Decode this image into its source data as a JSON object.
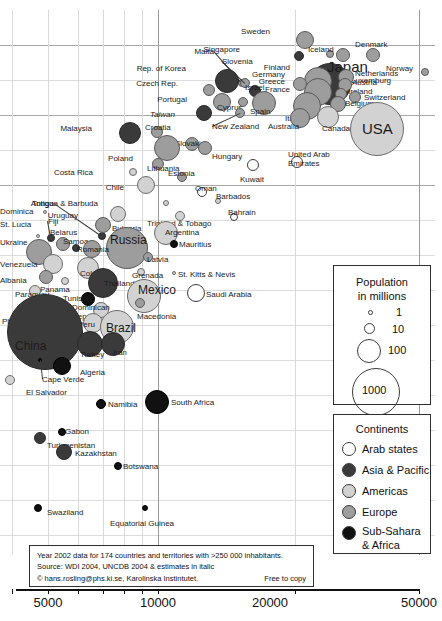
{
  "chart_data": {
    "type": "scatter",
    "title": "",
    "xlabel": "",
    "ylabel": "",
    "xscale": "log",
    "xticks": [
      "5000",
      "10000",
      "20000",
      "50000"
    ],
    "xtick_values": [
      5000,
      10000,
      20000,
      50000
    ],
    "xlim": [
      1800,
      60000
    ],
    "grid": true,
    "legend_position": "right",
    "size_legend": {
      "title_line1": "Population",
      "title_line2": "in millions",
      "entries": [
        {
          "label": "1",
          "value": 1
        },
        {
          "label": "10",
          "value": 10
        },
        {
          "label": "100",
          "value": 100
        },
        {
          "label": "1000",
          "value": 1000
        }
      ]
    },
    "color_legend": {
      "title": "Continents",
      "entries": [
        {
          "label": "Arab states",
          "color": "#ffffff",
          "key": "arab"
        },
        {
          "label": "Asia & Pacific",
          "color": "#3a3a3a",
          "key": "asia"
        },
        {
          "label": "Americas",
          "color": "#d2d2d2",
          "key": "amer"
        },
        {
          "label": "Europe",
          "color": "#9d9d9d",
          "key": "euro"
        },
        {
          "label": "Sub-Sahara",
          "label2": "& Africa",
          "color": "#111111",
          "key": "afri"
        }
      ]
    },
    "note": {
      "line1": "Year 2002 data for 174 countries and territories with >250 000 inhabitants.",
      "line2": "Source: WDI 2004, UNCDB 2004 & estimates in italic",
      "line3": "© hans.rosling@phs.ki.se, Karolinska Instintutet.",
      "line4": "Free to copy"
    },
    "points": [
      {
        "name": "Sweden",
        "cont": "euro",
        "cx": 305,
        "cy": 40,
        "r": 9,
        "lx": 270,
        "ly": 27,
        "anchor": "end"
      },
      {
        "name": "Singapore",
        "cont": "asia",
        "cx": 299,
        "cy": 56,
        "r": 5,
        "lx": 240,
        "ly": 45,
        "anchor": "end"
      },
      {
        "name": "Iceland",
        "cont": "euro",
        "cx": 330,
        "cy": 54,
        "r": 4,
        "lx": 308,
        "ly": 45,
        "anchor": "start"
      },
      {
        "name": "Denmark",
        "cont": "euro",
        "cx": 343,
        "cy": 55,
        "r": 7,
        "lx": 355,
        "ly": 40,
        "anchor": "start"
      },
      {
        "name": "Norway",
        "cont": "euro",
        "cx": 373,
        "cy": 55,
        "r": 7,
        "lx": 386,
        "ly": 64,
        "anchor": "start"
      },
      {
        "name": "Finland",
        "cont": "euro",
        "cx": 323,
        "cy": 71,
        "r": 6,
        "lx": 290,
        "ly": 63,
        "anchor": "end"
      },
      {
        "name": "Japan",
        "cont": "asia",
        "cx": 330,
        "cy": 84,
        "r": 21,
        "lx": 327,
        "ly": 59,
        "anchor": "start",
        "size": "big"
      },
      {
        "name": "Luxemburg",
        "cont": "euro",
        "cx": 425,
        "cy": 72,
        "r": 4,
        "lx": 391,
        "ly": 76,
        "anchor": "end"
      },
      {
        "name": "Netherlands",
        "cont": "euro",
        "cx": 346,
        "cy": 77,
        "r": 8,
        "lx": 355,
        "ly": 69,
        "anchor": "start"
      },
      {
        "name": "Malta",
        "cont": "euro",
        "cx": 242,
        "cy": 83,
        "r": 4,
        "lx": 214,
        "ly": 47,
        "anchor": "end",
        "leader": true
      },
      {
        "name": "Slovenia",
        "cont": "euro",
        "cx": 245,
        "cy": 83,
        "r": 5,
        "lx": 222,
        "ly": 57,
        "anchor": "start",
        "leader": true
      },
      {
        "name": "Rep. of Korea",
        "cont": "asia",
        "cx": 227,
        "cy": 81,
        "r": 12,
        "lx": 186,
        "ly": 64,
        "anchor": "end"
      },
      {
        "name": "Germany",
        "cont": "euro",
        "cx": 318,
        "cy": 81,
        "r": 14,
        "lx": 285,
        "ly": 70,
        "anchor": "end"
      },
      {
        "name": "Greece",
        "cont": "euro",
        "cx": 300,
        "cy": 84,
        "r": 7,
        "lx": 285,
        "ly": 77,
        "anchor": "end"
      },
      {
        "name": "Austria",
        "cont": "euro",
        "cx": 345,
        "cy": 85,
        "r": 7,
        "lx": 352,
        "ly": 78,
        "anchor": "start"
      },
      {
        "name": "Czech Rep.",
        "cont": "euro",
        "cx": 209,
        "cy": 90,
        "r": 6,
        "lx": 178,
        "ly": 79,
        "anchor": "end"
      },
      {
        "name": "Israel",
        "cont": "asia",
        "cx": 255,
        "cy": 91,
        "r": 6,
        "lx": 245,
        "ly": 83,
        "anchor": "start"
      },
      {
        "name": "France",
        "cont": "euro",
        "cx": 318,
        "cy": 92,
        "r": 14,
        "lx": 290,
        "ly": 85,
        "anchor": "end"
      },
      {
        "name": "Ireland",
        "cont": "euro",
        "cx": 341,
        "cy": 94,
        "r": 6,
        "lx": 348,
        "ly": 87,
        "anchor": "start"
      },
      {
        "name": "Switzerland",
        "cont": "euro",
        "cx": 355,
        "cy": 97,
        "r": 6,
        "lx": 364,
        "ly": 93,
        "anchor": "start"
      },
      {
        "name": "Portugal",
        "cont": "euro",
        "cx": 222,
        "cy": 102,
        "r": 9,
        "lx": 187,
        "ly": 95,
        "anchor": "end"
      },
      {
        "name": "Cyprus",
        "cont": "euro",
        "cx": 243,
        "cy": 102,
        "r": 5,
        "lx": 217,
        "ly": 103,
        "anchor": "start"
      },
      {
        "name": "Spain",
        "cont": "euro",
        "cx": 264,
        "cy": 103,
        "r": 12,
        "lx": 250,
        "ly": 107,
        "anchor": "start"
      },
      {
        "name": "Italy",
        "cont": "euro",
        "cx": 307,
        "cy": 106,
        "r": 14,
        "lx": 285,
        "ly": 114,
        "anchor": "start"
      },
      {
        "name": "Belgium",
        "cont": "euro",
        "cx": 338,
        "cy": 104,
        "r": 8,
        "lx": 345,
        "ly": 99,
        "anchor": "start"
      },
      {
        "name": "Canada",
        "cont": "amer",
        "cx": 328,
        "cy": 117,
        "r": 11,
        "lx": 322,
        "ly": 124,
        "anchor": "start"
      },
      {
        "name": "Australia",
        "cont": "euro",
        "cx": 300,
        "cy": 118,
        "r": 10,
        "lx": 268,
        "ly": 122,
        "anchor": "start"
      },
      {
        "name": "New Zealand",
        "cont": "euro",
        "cx": 240,
        "cy": 113,
        "r": 5,
        "lx": 212,
        "ly": 122,
        "anchor": "start",
        "leader": true
      },
      {
        "name": "Taiwan",
        "cont": "asia",
        "cx": 204,
        "cy": 113,
        "r": 8,
        "lx": 175,
        "ly": 110,
        "anchor": "end",
        "ital": true
      },
      {
        "name": "USA",
        "cont": "amer",
        "cx": 377,
        "cy": 129,
        "r": 27,
        "lx": 362,
        "ly": 121,
        "anchor": "start",
        "size": "big"
      },
      {
        "name": "Malaysia",
        "cont": "asia",
        "cx": 130,
        "cy": 133,
        "r": 11,
        "lx": 92,
        "ly": 124,
        "anchor": "end"
      },
      {
        "name": "Croatia",
        "cont": "euro",
        "cx": 157,
        "cy": 132,
        "r": 6,
        "lx": 145,
        "ly": 123,
        "anchor": "start"
      },
      {
        "name": "Slovakia",
        "cont": "euro",
        "cx": 192,
        "cy": 144,
        "r": 7,
        "lx": 175,
        "ly": 139,
        "anchor": "start"
      },
      {
        "name": "Hungary",
        "cont": "euro",
        "cx": 205,
        "cy": 148,
        "r": 7,
        "lx": 212,
        "ly": 152,
        "anchor": "start"
      },
      {
        "name": "Poland",
        "cont": "euro",
        "cx": 167,
        "cy": 148,
        "r": 13,
        "lx": 133,
        "ly": 154,
        "anchor": "end"
      },
      {
        "name": "Lithuania",
        "cont": "euro",
        "cx": 158,
        "cy": 164,
        "r": 6,
        "lx": 147,
        "ly": 164,
        "anchor": "start"
      },
      {
        "name": "Estonia",
        "cont": "euro",
        "cx": 182,
        "cy": 177,
        "r": 5,
        "lx": 168,
        "ly": 169,
        "anchor": "start"
      },
      {
        "name": "Costa Rica",
        "cont": "amer",
        "cx": 133,
        "cy": 172,
        "r": 4,
        "lx": 93,
        "ly": 168,
        "anchor": "end"
      },
      {
        "name": "Chile",
        "cont": "amer",
        "cx": 146,
        "cy": 185,
        "r": 9,
        "lx": 124,
        "ly": 183,
        "anchor": "end"
      },
      {
        "name": "Kuwait",
        "cont": "arab",
        "cx": 253,
        "cy": 165,
        "r": 6,
        "lx": 240,
        "ly": 175,
        "anchor": "start"
      },
      {
        "name": "United Arab Emirates",
        "cont": "arab",
        "cx": 297,
        "cy": 162,
        "r": 6,
        "lx": 288,
        "ly": 150,
        "anchor": "start",
        "two": "Emirates"
      },
      {
        "name": "Oman",
        "cont": "arab",
        "cx": 202,
        "cy": 192,
        "r": 5,
        "lx": 195,
        "ly": 184,
        "anchor": "start"
      },
      {
        "name": "Barbados",
        "cont": "amer",
        "cx": 218,
        "cy": 201,
        "r": 3,
        "lx": 216,
        "ly": 192,
        "anchor": "start"
      },
      {
        "name": "Bahrain",
        "cont": "arab",
        "cx": 234,
        "cy": 217,
        "r": 4,
        "lx": 228,
        "ly": 208,
        "anchor": "start"
      },
      {
        "name": "Antigua & Barbuda",
        "cont": "amer",
        "cx": 166,
        "cy": 203,
        "r": 3,
        "lx": 98,
        "ly": 199,
        "anchor": "end"
      },
      {
        "name": "Uruguay",
        "cont": "amer",
        "cx": 118,
        "cy": 214,
        "r": 8,
        "lx": 78,
        "ly": 211,
        "anchor": "end"
      },
      {
        "name": "Tonga",
        "cont": "asia",
        "cx": 102,
        "cy": 236,
        "r": 4,
        "lx": 54,
        "ly": 199,
        "anchor": "end",
        "leader": true
      },
      {
        "name": "Bulgaria",
        "cont": "euro",
        "cx": 103,
        "cy": 225,
        "r": 8,
        "lx": 112,
        "ly": 224,
        "anchor": "start"
      },
      {
        "name": "Trinidad & Tobago",
        "cont": "amer",
        "cx": 180,
        "cy": 216,
        "r": 5,
        "lx": 147,
        "ly": 219,
        "anchor": "start"
      },
      {
        "name": "Argentina",
        "cont": "amer",
        "cx": 166,
        "cy": 233,
        "r": 12,
        "lx": 165,
        "ly": 228,
        "anchor": "start"
      },
      {
        "name": "Russia",
        "cont": "euro",
        "cx": 127,
        "cy": 248,
        "r": 21,
        "lx": 110,
        "ly": 234,
        "anchor": "start",
        "size": "mid"
      },
      {
        "name": "Mauritius",
        "cont": "afri",
        "cx": 174,
        "cy": 244,
        "r": 4,
        "lx": 179,
        "ly": 240,
        "anchor": "start"
      },
      {
        "name": "Dominica",
        "cont": "amer",
        "cx": 45,
        "cy": 212,
        "r": 2,
        "lx": 9,
        "ly": 207,
        "anchor": "end"
      },
      {
        "name": "Fiji",
        "cont": "asia",
        "cx": 51,
        "cy": 238,
        "r": 4,
        "lx": 48,
        "ly": 217,
        "anchor": "start",
        "leader": true
      },
      {
        "name": "St. Lucia",
        "cont": "amer",
        "cx": 38,
        "cy": 236,
        "r": 2,
        "lx": 7,
        "ly": 220,
        "anchor": "end"
      },
      {
        "name": "Belarus",
        "cont": "euro",
        "cx": 63,
        "cy": 244,
        "r": 7,
        "lx": 50,
        "ly": 228,
        "anchor": "start"
      },
      {
        "name": "Ukraine",
        "cont": "euro",
        "cx": 39,
        "cy": 252,
        "r": 13,
        "lx": 5,
        "ly": 238,
        "anchor": "end"
      },
      {
        "name": "Samoa",
        "cont": "asia",
        "cx": 76,
        "cy": 248,
        "r": 4,
        "lx": 63,
        "ly": 237,
        "anchor": "start"
      },
      {
        "name": "Romania",
        "cont": "euro",
        "cx": 92,
        "cy": 249,
        "r": 9,
        "lx": 77,
        "ly": 245,
        "anchor": "start"
      },
      {
        "name": "Latvia",
        "cont": "euro",
        "cx": 148,
        "cy": 257,
        "r": 5,
        "lx": 147,
        "ly": 255,
        "anchor": "start"
      },
      {
        "name": "Venezuela",
        "cont": "amer",
        "cx": 53,
        "cy": 264,
        "r": 10,
        "lx": 4,
        "ly": 260,
        "anchor": "end"
      },
      {
        "name": "Colombia",
        "cont": "amer",
        "cx": 88,
        "cy": 268,
        "r": 11,
        "lx": 80,
        "ly": 269,
        "anchor": "start"
      },
      {
        "name": "Grenada",
        "cont": "amer",
        "cx": 141,
        "cy": 272,
        "r": 4,
        "lx": 132,
        "ly": 271,
        "anchor": "start"
      },
      {
        "name": "St. Kitts & Nevis",
        "cont": "amer",
        "cx": 174,
        "cy": 273,
        "r": 2,
        "lx": 178,
        "ly": 270,
        "anchor": "start"
      },
      {
        "name": "Albania",
        "cont": "euro",
        "cx": 46,
        "cy": 277,
        "r": 7,
        "lx": 10,
        "ly": 276,
        "anchor": "end"
      },
      {
        "name": "Panama",
        "cont": "amer",
        "cx": 65,
        "cy": 281,
        "r": 4,
        "lx": 40,
        "ly": 285,
        "anchor": "start"
      },
      {
        "name": "Thailand",
        "cont": "asia",
        "cx": 103,
        "cy": 283,
        "r": 15,
        "lx": 104,
        "ly": 279,
        "anchor": "start"
      },
      {
        "name": "Mexico",
        "cont": "amer",
        "cx": 144,
        "cy": 296,
        "r": 17,
        "lx": 138,
        "ly": 284,
        "anchor": "start",
        "size": "mid"
      },
      {
        "name": "Saudi Arabia",
        "cont": "arab",
        "cx": 196,
        "cy": 293,
        "r": 9,
        "lx": 206,
        "ly": 290,
        "anchor": "start"
      },
      {
        "name": "Tunisia",
        "cont": "afri",
        "cx": 88,
        "cy": 299,
        "r": 7,
        "lx": 63,
        "ly": 294,
        "anchor": "start"
      },
      {
        "name": "Paraguay",
        "cont": "amer",
        "cx": 35,
        "cy": 291,
        "r": 6,
        "lx": 15,
        "ly": 290,
        "anchor": "start"
      },
      {
        "name": "Dominican Rep.",
        "cont": "amer",
        "cx": 101,
        "cy": 310,
        "r": 8,
        "lx": 72,
        "ly": 303,
        "anchor": "start",
        "two": "Rep."
      },
      {
        "name": "Macedonia",
        "cont": "euro",
        "cx": 140,
        "cy": 303,
        "r": 5,
        "lx": 137,
        "ly": 312,
        "anchor": "start"
      },
      {
        "name": "Lebanon",
        "cont": "arab",
        "cx": 45,
        "cy": 310,
        "r": 5,
        "lx": 40,
        "ly": 310,
        "anchor": "start"
      },
      {
        "name": "Philippines",
        "cont": "asia",
        "cx": 30,
        "cy": 317,
        "r": 12,
        "lx": 2,
        "ly": 317,
        "anchor": "start"
      },
      {
        "name": "Peru",
        "cont": "amer",
        "cx": 93,
        "cy": 323,
        "r": 10,
        "lx": 78,
        "ly": 320,
        "anchor": "start"
      },
      {
        "name": "Brazil",
        "cont": "amer",
        "cx": 117,
        "cy": 327,
        "r": 17,
        "lx": 106,
        "ly": 322,
        "anchor": "start",
        "size": "mid"
      },
      {
        "name": "Belize",
        "cont": "amer",
        "cx": 60,
        "cy": 334,
        "r": 2,
        "lx": 52,
        "ly": 329,
        "anchor": "start"
      },
      {
        "name": "China",
        "cont": "asia",
        "cx": 45,
        "cy": 332,
        "r": 38,
        "lx": 15,
        "ly": 340,
        "anchor": "start",
        "size": "mid"
      },
      {
        "name": "Turkey",
        "cont": "asia",
        "cx": 90,
        "cy": 344,
        "r": 13,
        "lx": 80,
        "ly": 350,
        "anchor": "start"
      },
      {
        "name": "Iran",
        "cont": "asia",
        "cx": 113,
        "cy": 344,
        "r": 12,
        "lx": 113,
        "ly": 348,
        "anchor": "start"
      },
      {
        "name": "Cape Verde",
        "cont": "afri",
        "cx": 40,
        "cy": 360,
        "r": 2,
        "lx": 42,
        "ly": 375,
        "anchor": "start",
        "leader": true
      },
      {
        "name": "Algeria",
        "cont": "afri",
        "cx": 62,
        "cy": 366,
        "r": 9,
        "lx": 80,
        "ly": 368,
        "anchor": "start"
      },
      {
        "name": "El Salvador",
        "cont": "amer",
        "cx": 10,
        "cy": 380,
        "r": 5,
        "lx": 26,
        "ly": 388,
        "anchor": "start"
      },
      {
        "name": "Namibia",
        "cont": "afri",
        "cx": 101,
        "cy": 404,
        "r": 5,
        "lx": 108,
        "ly": 400,
        "anchor": "start"
      },
      {
        "name": "South Africa",
        "cont": "afri",
        "cx": 157,
        "cy": 402,
        "r": 12,
        "lx": 171,
        "ly": 398,
        "anchor": "start"
      },
      {
        "name": "Gabon",
        "cont": "afri",
        "cx": 62,
        "cy": 432,
        "r": 4,
        "lx": 65,
        "ly": 427,
        "anchor": "start"
      },
      {
        "name": "Turkmenistan",
        "cont": "asia",
        "cx": 40,
        "cy": 438,
        "r": 6,
        "lx": 47,
        "ly": 441,
        "anchor": "start"
      },
      {
        "name": "Kazakhstan",
        "cont": "asia",
        "cx": 64,
        "cy": 452,
        "r": 8,
        "lx": 75,
        "ly": 449,
        "anchor": "start"
      },
      {
        "name": "Botswana",
        "cont": "afri",
        "cx": 118,
        "cy": 466,
        "r": 4,
        "lx": 123,
        "ly": 462,
        "anchor": "start"
      },
      {
        "name": "Swaziland",
        "cont": "afri",
        "cx": 38,
        "cy": 508,
        "r": 4,
        "lx": 47,
        "ly": 508,
        "anchor": "start"
      },
      {
        "name": "Equatorial Guinea",
        "cont": "afri",
        "cx": 145,
        "cy": 508,
        "r": 3,
        "lx": 110,
        "ly": 519,
        "anchor": "start"
      }
    ],
    "gridlines_v": [
      12,
      48,
      78,
      103,
      124,
      142,
      158,
      295,
      419
    ],
    "gridlines_v_major": [
      158,
      419
    ],
    "gridlines_h": [
      35,
      70,
      105,
      140,
      175,
      210,
      245,
      280,
      315,
      350,
      385,
      420,
      455,
      490,
      525
    ],
    "gridlines_h_major": [
      35,
      105,
      175
    ]
  }
}
